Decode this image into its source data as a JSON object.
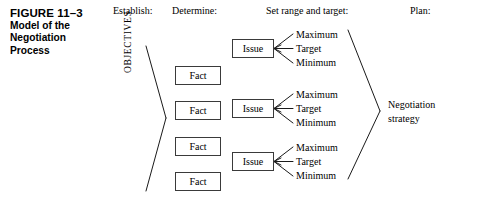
{
  "figure": {
    "number": "FIGURE 11–3",
    "title_line_1": "Model of the",
    "title_line_2": "Negotiation",
    "title_line_3": "Process"
  },
  "columns": [
    {
      "key": "establish",
      "label": "Establish:"
    },
    {
      "key": "determine",
      "label": "Determine:"
    },
    {
      "key": "range",
      "label": "Set range and target:"
    },
    {
      "key": "plan",
      "label": "Plan:"
    }
  ],
  "objectives_label": "OBJECTIVES",
  "facts": [
    {
      "label": "Fact"
    },
    {
      "label": "Fact"
    },
    {
      "label": "Fact"
    },
    {
      "label": "Fact"
    }
  ],
  "issues": [
    {
      "label": "Issue",
      "range": {
        "maximum": "Maximum",
        "target": "Target",
        "minimum": "Minimum"
      }
    },
    {
      "label": "Issue",
      "range": {
        "maximum": "Maximum",
        "target": "Target",
        "minimum": "Minimum"
      }
    },
    {
      "label": "Issue",
      "range": {
        "maximum": "Maximum",
        "target": "Target",
        "minimum": "Minimum"
      }
    }
  ],
  "outcome": {
    "line_1": "Negotiation",
    "line_2": "strategy"
  },
  "colors": {
    "background": "#ffffff",
    "text": "#000000",
    "box_border": "#3a3a3a",
    "line": "#1a1a1a"
  }
}
